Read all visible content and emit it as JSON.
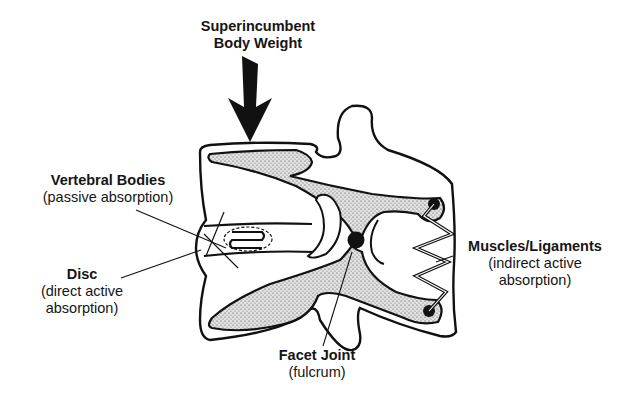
{
  "diagram": {
    "type": "anatomical-line-drawing",
    "labels": {
      "weight": {
        "title_line1": "Superincumbent",
        "title_line2": "Body Weight"
      },
      "vertebral_bodies": {
        "title": "Vertebral Bodies",
        "subtitle": "(passive absorption)"
      },
      "disc": {
        "title": "Disc",
        "subtitle_line1": "(direct active",
        "subtitle_line2": "absorption)"
      },
      "muscles": {
        "title": "Muscles/Ligaments",
        "subtitle_line1": "(indirect active",
        "subtitle_line2": "absorption)"
      },
      "facet": {
        "title": "Facet Joint",
        "subtitle": "(fulcrum)"
      }
    },
    "elements": [
      "load-arrow",
      "vertebral-body-upper",
      "vertebral-body-lower",
      "intervertebral-disc",
      "facet-joint-fulcrum",
      "spring-muscles-ligaments",
      "attachment-points"
    ],
    "colors": {
      "ink": "#111111",
      "stipple_bg": "#d9d9d9",
      "background": "#ffffff"
    }
  }
}
